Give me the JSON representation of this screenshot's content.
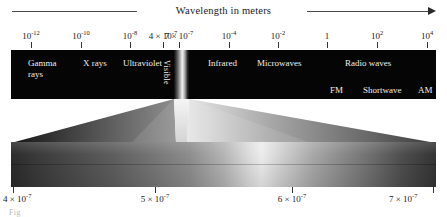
{
  "figure": {
    "title": "Wavelength in meters",
    "caption": "Fig"
  },
  "top_axis": {
    "ticks": [
      {
        "label": "10",
        "exp": "-12",
        "x": 31
      },
      {
        "label": "10",
        "exp": "-10",
        "x": 81
      },
      {
        "label": "10",
        "exp": "-8",
        "x": 130
      },
      {
        "label": "4 × 10",
        "exp": "-7",
        "x": 163
      },
      {
        "label": "7 × 10",
        "exp": "-7",
        "x": 179
      },
      {
        "label": "10",
        "exp": "-4",
        "x": 229
      },
      {
        "label": "10",
        "exp": "-2",
        "x": 278
      },
      {
        "label": "1",
        "exp": "",
        "x": 327
      },
      {
        "label": "10",
        "exp": "2",
        "x": 377
      },
      {
        "label": "10",
        "exp": "4",
        "x": 427
      }
    ]
  },
  "bands": [
    {
      "name": "gamma-rays",
      "label_line1": "Gamma",
      "label_line2": "rays",
      "x": 17,
      "y": 8
    },
    {
      "name": "x-rays",
      "label_line1": "X rays",
      "label_line2": "",
      "x": 72,
      "y": 8
    },
    {
      "name": "ultraviolet",
      "label_line1": "Ultraviolet",
      "label_line2": "",
      "x": 112,
      "y": 8
    },
    {
      "name": "infrared",
      "label_line1": "Infrared",
      "label_line2": "",
      "x": 197,
      "y": 8
    },
    {
      "name": "microwaves",
      "label_line1": "Microwaves",
      "label_line2": "",
      "x": 246,
      "y": 8
    },
    {
      "name": "radio-waves",
      "label_line1": "Radio waves",
      "label_line2": "",
      "x": 334,
      "y": 8
    }
  ],
  "visible_label": "Visible",
  "radio_subbands": [
    {
      "name": "fm",
      "label": "FM",
      "x": 330
    },
    {
      "name": "shortwave",
      "label": "Shortwave",
      "x": 363
    },
    {
      "name": "am",
      "label": "AM",
      "x": 418
    }
  ],
  "bottom_axis": {
    "ticks": [
      {
        "label": "4 × 10",
        "exp": "-7",
        "x": 13,
        "align": "left"
      },
      {
        "label": "5 × 10",
        "exp": "-7",
        "x": 155,
        "align": "center"
      },
      {
        "label": "6 × 10",
        "exp": "-7",
        "x": 292,
        "align": "center"
      },
      {
        "label": "7 × 10",
        "exp": "-7",
        "x": 433,
        "align": "right"
      }
    ]
  },
  "chart_data": {
    "type": "diagram",
    "xlabel": "Wavelength in meters",
    "top_scale_ticks": [
      "10^-12",
      "10^-10",
      "10^-8",
      "4 × 10^-7",
      "7 × 10^-7",
      "10^-4",
      "10^-2",
      "1",
      "10^2",
      "10^4"
    ],
    "regions": [
      "Gamma rays",
      "X rays",
      "Ultraviolet",
      "Visible",
      "Infrared",
      "Microwaves",
      "Radio waves"
    ],
    "radio_subregions": [
      "FM",
      "Shortwave",
      "AM"
    ],
    "detail_scale_ticks": [
      "4 × 10^-7",
      "5 × 10^-7",
      "6 × 10^-7",
      "7 × 10^-7"
    ],
    "detail_note": "Expanded view of the visible band from 4 × 10^-7 m to 7 × 10^-7 m"
  }
}
